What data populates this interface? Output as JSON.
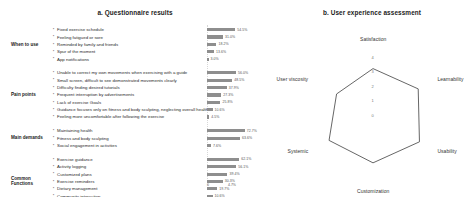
{
  "figure": {
    "panel_a_title": "a. Questionnaire results",
    "panel_b_title": "b. User experience assessment"
  },
  "bar_axis": {
    "ticks": [
      "0",
      "4.7%"
    ]
  },
  "chart_data": [
    {
      "type": "bar",
      "title": "a. Questionnaire results",
      "xlabel": "",
      "ylabel": "",
      "orientation": "horizontal",
      "grid": false,
      "groups": [
        {
          "label": "When to use",
          "categories": [
            "Fixed exercise schedule",
            "Feeling fatigued or sore",
            "Reminded by family and friends",
            "Spur of the moment",
            "App notifications"
          ],
          "values": [
            54.5,
            31.0,
            18.2,
            13.6,
            3.0
          ],
          "value_labels": [
            "54.5%",
            "31.0%",
            "18.2%",
            "13.6%",
            "3.0%"
          ]
        },
        {
          "label": "Pain points",
          "categories": [
            "Unable to correct my own movements when exercising with a guide",
            "Small screen, difficult to see demonstrated movements clearly",
            "Difficulty finding desired tutorials",
            "Frequent interruption by advertisements",
            "Lack of exercise Goals",
            "Guidance focuses only on fitness and body sculpting, neglecting overall health",
            "Feeling more uncomfortable after following the exercise"
          ],
          "values": [
            56.0,
            48.5,
            37.9,
            27.3,
            25.8,
            10.6,
            4.5
          ],
          "value_labels": [
            "56.0%",
            "48.5%",
            "37.9%",
            "27.3%",
            "25.8%",
            "10.6%",
            "4.5%"
          ]
        },
        {
          "label": "Main demands",
          "categories": [
            "Maintaining health",
            "Fitness and body sculpting",
            "Social engagement in activities"
          ],
          "values": [
            72.7,
            63.6,
            7.6
          ],
          "value_labels": [
            "72.7%",
            "63.6%",
            "7.6%"
          ]
        },
        {
          "label": "Common Functions",
          "categories": [
            "Exercise guidance",
            "Activity logging",
            "Customized plans",
            "Exercise reminders",
            "Dietary management",
            "Community interaction",
            "Purchase of goods"
          ],
          "values": [
            62.1,
            56.1,
            39.4,
            30.3,
            19.7,
            10.6,
            4.5
          ],
          "value_labels": [
            "62.1%",
            "56.1%",
            "39.4%",
            "30.3%",
            "19.7%",
            "10.6%",
            "4.5%"
          ]
        }
      ]
    },
    {
      "type": "radar",
      "title": "b. User experience assessment",
      "axes": [
        "Satisfaction",
        "Learnability",
        "Usability",
        "Customization",
        "Systemic",
        "User viscosity"
      ],
      "values": [
        3.2,
        3.6,
        3.7,
        3.3,
        3.5,
        2.9
      ],
      "rlim": [
        0,
        4
      ],
      "tick_labels": [
        "0",
        "1",
        "2",
        "3",
        "4"
      ],
      "grid": false,
      "legend": ""
    }
  ]
}
